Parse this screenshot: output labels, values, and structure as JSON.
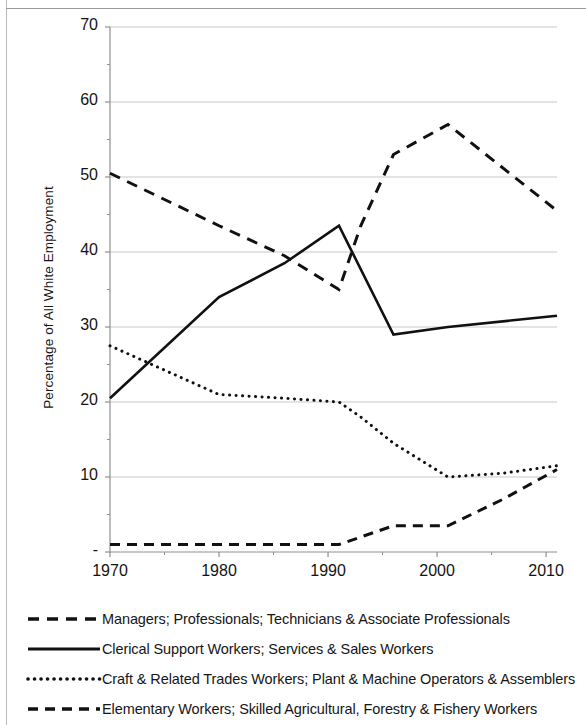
{
  "yaxis": {
    "title": "Percentage of All White Employment",
    "ticks": [
      "70",
      "60",
      "50",
      "40",
      "30",
      "20",
      "10",
      "-"
    ],
    "min": 0,
    "max": 70,
    "step": 10
  },
  "xaxis": {
    "ticks": [
      "1970",
      "1980",
      "1990",
      "2000",
      "2010"
    ],
    "min": 1970,
    "max": 2011
  },
  "legend": {
    "items": [
      {
        "label": "Managers; Professionals; Technicians & Associate Professionals",
        "style": "long-dash"
      },
      {
        "label": "Clerical Support Workers; Services & Sales Workers",
        "style": "solid"
      },
      {
        "label": "Craft & Related Trades Workers; Plant & Machine Operators & Assemblers",
        "style": "dotted"
      },
      {
        "label": "Elementary Workers; Skilled Agricultural, Forestry & Fishery Workers",
        "style": "dash"
      }
    ]
  },
  "colors": {
    "line": "#111111",
    "grid": "#c9c9c9",
    "axis": "#8f8f8f",
    "text": "#141414"
  },
  "chart_data": {
    "type": "line",
    "title": "",
    "xlabel": "",
    "ylabel": "Percentage of All White Employment",
    "xlim": [
      1970,
      2011
    ],
    "ylim": [
      0,
      70
    ],
    "grid": true,
    "legend_position": "bottom",
    "xticks": [
      1970,
      1980,
      1990,
      2000,
      2010
    ],
    "yticks": [
      0,
      10,
      20,
      30,
      40,
      50,
      60,
      70
    ],
    "series": [
      {
        "name": "Managers; Professionals; Technicians & Associate Professionals",
        "style": "long-dash",
        "x": [
          1970,
          1980,
          1986,
          1991,
          1993,
          1996,
          2001,
          2011
        ],
        "values": [
          50.5,
          43.5,
          39.5,
          35.0,
          43.5,
          53.0,
          57.0,
          45.5
        ]
      },
      {
        "name": "Clerical Support Workers; Services & Sales Workers",
        "style": "solid",
        "x": [
          1970,
          1980,
          1986,
          1991,
          1996,
          2001,
          2011
        ],
        "values": [
          20.5,
          34.0,
          38.5,
          43.5,
          29.0,
          30.0,
          31.5
        ]
      },
      {
        "name": "Craft & Related Trades Workers; Plant & Machine Operators & Assemblers",
        "style": "dotted",
        "x": [
          1970,
          1980,
          1986,
          1991,
          1993,
          1996,
          2001,
          2006,
          2011
        ],
        "values": [
          27.5,
          21.0,
          20.5,
          20.0,
          18.0,
          14.5,
          10.0,
          10.5,
          11.5
        ]
      },
      {
        "name": "Elementary Workers; Skilled Agricultural, Forestry & Fishery Workers",
        "style": "dash",
        "x": [
          1970,
          1980,
          1986,
          1991,
          1996,
          2001,
          2006,
          2011
        ],
        "values": [
          1.0,
          1.0,
          1.0,
          1.0,
          3.5,
          3.5,
          7.0,
          11.0
        ]
      }
    ]
  }
}
